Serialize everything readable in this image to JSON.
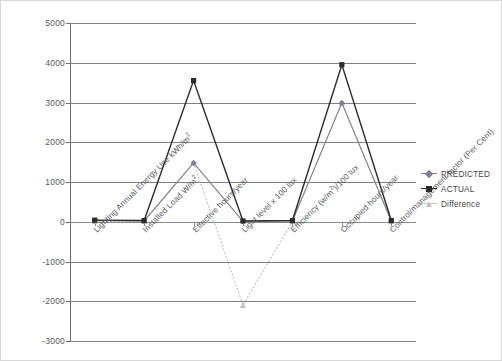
{
  "chart_data": {
    "type": "line",
    "title": "",
    "xlabel": "",
    "ylabel": "",
    "ylim": [
      -3000,
      5000
    ],
    "ytick_step": 1000,
    "grid": true,
    "legend_position": "right",
    "categories": [
      "Lighting Annual Energy Use kWh/m²",
      "Installed Load W/m²",
      "Effective hours/year",
      "Light level x 100 lux",
      "Efficiency (w/m²)/100 lux",
      "Occupied hours/year",
      "Control/management factor (Per Cent)"
    ],
    "yticks": [
      5000,
      4000,
      3000,
      2000,
      1000,
      0,
      -1000,
      -2000,
      -3000
    ],
    "series": [
      {
        "name": "PREDICTED",
        "color": "#7f7f93",
        "marker": "diamond",
        "values": [
          30,
          20,
          1480,
          10,
          20,
          2990,
          20
        ]
      },
      {
        "name": "ACTUAL",
        "color": "#2b2b2b",
        "marker": "square",
        "values": [
          40,
          30,
          3550,
          20,
          30,
          3950,
          30
        ]
      },
      {
        "name": "Difference",
        "color": "#c2c2c8",
        "marker": "triangle",
        "values": [
          10,
          10,
          1480,
          -2100,
          10,
          2990,
          10
        ]
      }
    ]
  },
  "legend": {
    "items": [
      {
        "label": "PREDICTED",
        "color": "#7f7f93",
        "marker": "diamond"
      },
      {
        "label": "ACTUAL",
        "color": "#2b2b2b",
        "marker": "square"
      },
      {
        "label": "Difference",
        "color": "#c2c2c8",
        "marker": "triangle"
      }
    ]
  },
  "axis": {
    "y_labels": [
      "5000",
      "4000",
      "3000",
      "2000",
      "1000",
      "0",
      "-1000",
      "-2000",
      "-3000"
    ],
    "x_labels": [
      "Lighting Annual Energy Use kWh/m²",
      "Installed Load W/m²",
      "Effective hours/year",
      "Light level x 100 lux",
      "Efficiency (w/m²)/100 lux",
      "Occupied hours/year",
      "Control/management factor (Per Cent)"
    ]
  }
}
